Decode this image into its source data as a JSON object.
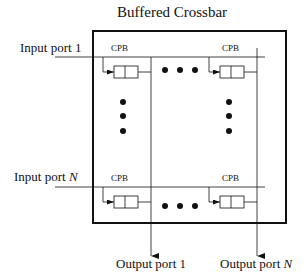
{
  "diagram": {
    "title": "Buffered Crossbar",
    "inputs": [
      {
        "label": "Input port ",
        "index": "1"
      },
      {
        "label": "Input port ",
        "index": "N"
      }
    ],
    "outputs": [
      {
        "label": "Output port ",
        "index": "1"
      },
      {
        "label": "Output port ",
        "index": "N"
      }
    ],
    "buffer_label": "CPB",
    "buffers": [
      {
        "row": "1",
        "col": "1",
        "label": "CPB"
      },
      {
        "row": "1",
        "col": "N",
        "label": "CPB"
      },
      {
        "row": "N",
        "col": "1",
        "label": "CPB"
      },
      {
        "row": "N",
        "col": "N",
        "label": "CPB"
      }
    ],
    "ellipsis": "• • •",
    "colors": {
      "stroke": "#111111",
      "background": "#ffffff"
    }
  }
}
